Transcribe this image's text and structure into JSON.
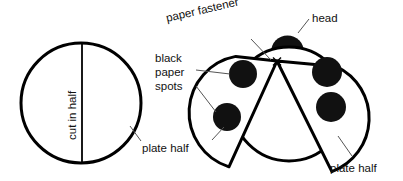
{
  "figure": {
    "stroke_color": "#000000",
    "fill_color": "#ffffff",
    "spot_color": "#111111",
    "leader_color": "#555555",
    "background": "#ffffff"
  },
  "labels": {
    "cut_in_half": "cut in half",
    "paper_fastener": "paper fastener",
    "head": "head",
    "black": "black",
    "paper": "paper",
    "spots": "spots",
    "plate_half_left": "plate half",
    "plate_half_right": "plate half",
    "fastener_mark": "×"
  },
  "left_figure": {
    "name": "whole-paper-plate",
    "circle": {
      "cx": 81,
      "cy": 103,
      "r": 60
    },
    "cut_line": {
      "x": 82,
      "y1": 43,
      "y2": 163
    },
    "label": "cut in half"
  },
  "right_figure": {
    "name": "assembled-ladybug",
    "body_circle": {
      "cx": 289,
      "cy": 104,
      "r": 57
    },
    "head": {
      "cx": 287,
      "cy": 48,
      "r": 16
    },
    "fastener_point": {
      "x": 277,
      "y": 61
    },
    "spots": [
      {
        "cx": 243,
        "cy": 74,
        "r": 14,
        "plate": "left"
      },
      {
        "cx": 227,
        "cy": 117,
        "r": 14,
        "plate": "left"
      },
      {
        "cx": 327,
        "cy": 72,
        "r": 15,
        "plate": "right"
      },
      {
        "cx": 331,
        "cy": 107,
        "r": 15,
        "plate": "right"
      }
    ]
  }
}
